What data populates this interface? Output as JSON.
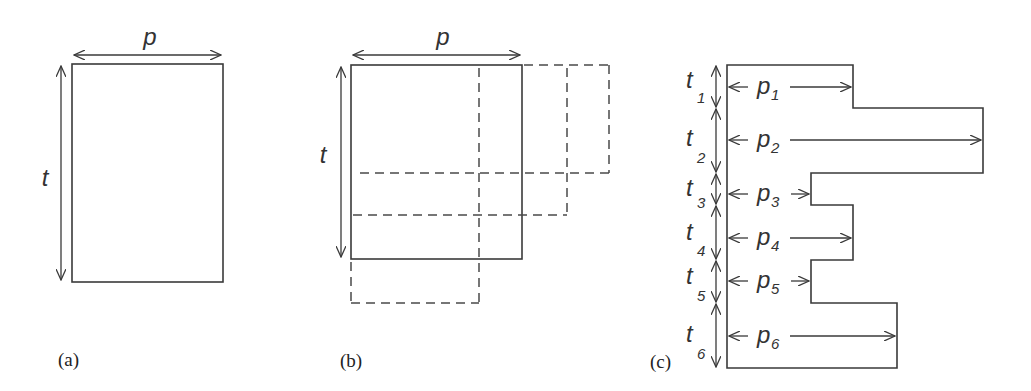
{
  "panels": {
    "a": {
      "caption": "(a)",
      "width_label": "p",
      "height_label": "t"
    },
    "b": {
      "caption": "(b)",
      "width_label": "p",
      "height_label": "t"
    },
    "c": {
      "caption": "(c)",
      "segments": [
        {
          "t": "t",
          "t_sub": "1",
          "p": "p",
          "p_sub": "1"
        },
        {
          "t": "t",
          "t_sub": "2",
          "p": "p",
          "p_sub": "2"
        },
        {
          "t": "t",
          "t_sub": "3",
          "p": "p",
          "p_sub": "3"
        },
        {
          "t": "t",
          "t_sub": "4",
          "p": "p",
          "p_sub": "4"
        },
        {
          "t": "t",
          "t_sub": "5",
          "p": "p",
          "p_sub": "5"
        },
        {
          "t": "t",
          "t_sub": "6",
          "p": "p",
          "p_sub": "6"
        }
      ]
    }
  },
  "colors": {
    "line": "#3a3a3a",
    "dashed": "#4a4a4a",
    "background": "#ffffff"
  }
}
